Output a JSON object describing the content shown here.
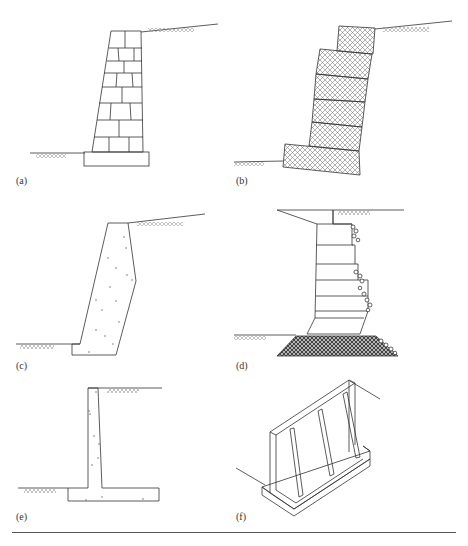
{
  "figure": {
    "panels": [
      {
        "id": "a",
        "label": "(a)",
        "type": "masonry-block-gravity-wall"
      },
      {
        "id": "b",
        "label": "(b)",
        "type": "gabion-crib-wall"
      },
      {
        "id": "c",
        "label": "(c)",
        "type": "mass-concrete-gravity-wall"
      },
      {
        "id": "d",
        "label": "(d)",
        "type": "stepped-gabion-wall-with-rock-apron"
      },
      {
        "id": "e",
        "label": "(e)",
        "type": "cantilever-t-wall"
      },
      {
        "id": "f",
        "label": "(f)",
        "type": "counterfort-wall-isometric"
      }
    ],
    "caption": ""
  },
  "colors": {
    "line": "#333333",
    "hatch": "#777777",
    "rule": "#555555"
  }
}
